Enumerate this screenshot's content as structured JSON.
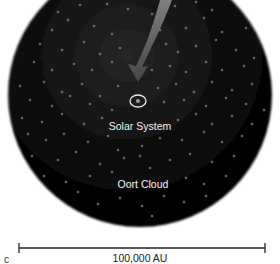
{
  "figure": {
    "panel_label": "c",
    "labels": {
      "solar_system": "Solar System",
      "oort_cloud": "Oort Cloud"
    },
    "scale_bar": {
      "label": "100,000 AU"
    },
    "colors": {
      "background": "#ffffff",
      "sphere_core": "#0a0a0a",
      "sphere_edge": "#000000",
      "dots": "#8a8a8a",
      "arrow": "#6e6e6e",
      "marker_ring": "#e8e8e8",
      "label_text": "#f2f2f2",
      "scale_bar": "#222222"
    },
    "sphere": {
      "cx": 140,
      "cy": 95,
      "r": 132
    },
    "marker": {
      "cx": 138,
      "cy": 101,
      "rx": 8,
      "ry": 6
    },
    "arrow": {
      "start": [
        168,
        0
      ],
      "tip": [
        138,
        80
      ]
    },
    "scale_line": {
      "x1": 19,
      "x2": 265,
      "y": 248
    },
    "dots": [
      [
        12,
        2
      ],
      [
        40,
        6
      ],
      [
        58,
        12
      ],
      [
        80,
        5
      ],
      [
        107,
        4
      ],
      [
        128,
        9
      ],
      [
        152,
        14
      ],
      [
        175,
        6
      ],
      [
        196,
        2
      ],
      [
        212,
        10
      ],
      [
        228,
        4
      ],
      [
        240,
        14
      ],
      [
        30,
        24
      ],
      [
        52,
        30
      ],
      [
        68,
        20
      ],
      [
        94,
        26
      ],
      [
        112,
        34
      ],
      [
        160,
        30
      ],
      [
        186,
        28
      ],
      [
        204,
        18
      ],
      [
        222,
        32
      ],
      [
        246,
        28
      ],
      [
        262,
        40
      ],
      [
        18,
        46
      ],
      [
        40,
        44
      ],
      [
        62,
        50
      ],
      [
        84,
        42
      ],
      [
        100,
        54
      ],
      [
        120,
        48
      ],
      [
        166,
        44
      ],
      [
        178,
        52
      ],
      [
        196,
        46
      ],
      [
        216,
        40
      ],
      [
        236,
        50
      ],
      [
        254,
        58
      ],
      [
        14,
        66
      ],
      [
        34,
        62
      ],
      [
        52,
        70
      ],
      [
        74,
        64
      ],
      [
        92,
        70
      ],
      [
        112,
        62
      ],
      [
        152,
        70
      ],
      [
        170,
        66
      ],
      [
        186,
        72
      ],
      [
        206,
        62
      ],
      [
        222,
        70
      ],
      [
        244,
        66
      ],
      [
        266,
        76
      ],
      [
        20,
        86
      ],
      [
        44,
        82
      ],
      [
        62,
        92
      ],
      [
        82,
        84
      ],
      [
        100,
        96
      ],
      [
        118,
        86
      ],
      [
        158,
        88
      ],
      [
        176,
        84
      ],
      [
        194,
        92
      ],
      [
        212,
        82
      ],
      [
        232,
        90
      ],
      [
        252,
        84
      ],
      [
        270,
        94
      ],
      [
        12,
        104
      ],
      [
        30,
        100
      ],
      [
        52,
        106
      ],
      [
        70,
        96
      ],
      [
        90,
        104
      ],
      [
        112,
        110
      ],
      [
        164,
        102
      ],
      [
        184,
        100
      ],
      [
        206,
        106
      ],
      [
        226,
        98
      ],
      [
        246,
        104
      ],
      [
        264,
        110
      ],
      [
        22,
        118
      ],
      [
        42,
        122
      ],
      [
        62,
        114
      ],
      [
        84,
        124
      ],
      [
        102,
        118
      ],
      [
        178,
        120
      ],
      [
        196,
        114
      ],
      [
        212,
        124
      ],
      [
        232,
        116
      ],
      [
        252,
        124
      ],
      [
        28,
        134
      ],
      [
        46,
        140
      ],
      [
        64,
        134
      ],
      [
        88,
        142
      ],
      [
        108,
        136
      ],
      [
        118,
        150
      ],
      [
        142,
        146
      ],
      [
        140,
        156
      ],
      [
        160,
        138
      ],
      [
        182,
        140
      ],
      [
        204,
        132
      ],
      [
        222,
        142
      ],
      [
        242,
        136
      ],
      [
        258,
        146
      ],
      [
        32,
        156
      ],
      [
        58,
        160
      ],
      [
        76,
        152
      ],
      [
        100,
        164
      ],
      [
        124,
        158
      ],
      [
        150,
        168
      ],
      [
        170,
        160
      ],
      [
        190,
        154
      ],
      [
        212,
        162
      ],
      [
        234,
        156
      ],
      [
        250,
        164
      ],
      [
        44,
        176
      ],
      [
        66,
        182
      ],
      [
        90,
        176
      ],
      [
        112,
        172
      ],
      [
        186,
        178
      ],
      [
        204,
        184
      ],
      [
        226,
        176
      ],
      [
        244,
        182
      ],
      [
        58,
        196
      ],
      [
        78,
        192
      ],
      [
        98,
        204
      ],
      [
        120,
        198
      ],
      [
        142,
        206
      ],
      [
        164,
        196
      ],
      [
        184,
        202
      ],
      [
        206,
        196
      ],
      [
        226,
        200
      ],
      [
        80,
        214
      ],
      [
        104,
        218
      ],
      [
        128,
        222
      ],
      [
        152,
        216
      ],
      [
        176,
        218
      ],
      [
        198,
        212
      ]
    ]
  }
}
